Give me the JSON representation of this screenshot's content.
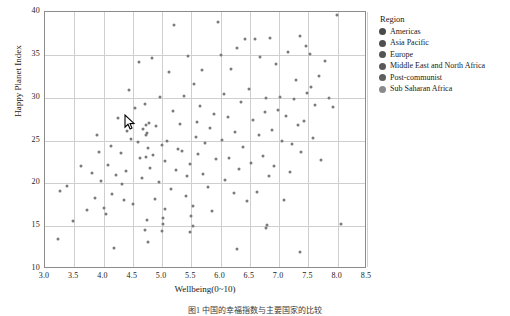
{
  "chart_data": {
    "type": "scatter",
    "title": "",
    "xlabel": "Wellbeing(0~10)",
    "ylabel": "Happy Planet Index",
    "xlim": [
      3.0,
      8.5
    ],
    "ylim": [
      10,
      40
    ],
    "grid": true,
    "legend_position": "right",
    "xticks": [
      "3.0",
      "3.5",
      "4.0",
      "4.5",
      "5.0",
      "5.5",
      "6.0",
      "6.5",
      "7.0",
      "7.5",
      "8.0",
      "8.5"
    ],
    "yticks": [
      "10",
      "15",
      "20",
      "25",
      "30",
      "35",
      "40"
    ],
    "xtick_values": [
      3.0,
      3.5,
      4.0,
      4.5,
      5.0,
      5.5,
      6.0,
      6.5,
      7.0,
      7.5,
      8.0,
      8.5
    ],
    "ytick_values": [
      10,
      15,
      20,
      25,
      30,
      35,
      40
    ],
    "marker_color": "#7a7a7a",
    "marker_size": 3,
    "legend": {
      "title": "Region",
      "entries": [
        {
          "label": "Americas",
          "color": "#4a4a4a"
        },
        {
          "label": "Asia Pacific",
          "color": "#4f4f4f"
        },
        {
          "label": "Europe",
          "color": "#545454"
        },
        {
          "label": "Middle East and North Africa",
          "color": "#595959"
        },
        {
          "label": "Post-communist",
          "color": "#5e5e5e"
        },
        {
          "label": "Sub Saharan Africa",
          "color": "#8a8a8a"
        }
      ]
    },
    "points": [
      [
        3.22,
        13.5
      ],
      [
        3.25,
        19.1
      ],
      [
        3.38,
        19.7
      ],
      [
        3.47,
        15.6
      ],
      [
        3.62,
        22.0
      ],
      [
        3.72,
        16.9
      ],
      [
        3.8,
        21.2
      ],
      [
        3.85,
        18.3
      ],
      [
        3.88,
        25.6
      ],
      [
        3.93,
        23.7
      ],
      [
        3.96,
        20.3
      ],
      [
        4.0,
        17.1
      ],
      [
        4.05,
        16.4
      ],
      [
        4.08,
        22.1
      ],
      [
        4.12,
        24.3
      ],
      [
        4.15,
        18.8
      ],
      [
        4.18,
        12.4
      ],
      [
        4.22,
        21.0
      ],
      [
        4.25,
        27.6
      ],
      [
        4.3,
        23.5
      ],
      [
        4.32,
        19.9
      ],
      [
        4.35,
        18.0
      ],
      [
        4.38,
        21.4
      ],
      [
        4.4,
        26.1
      ],
      [
        4.44,
        30.9
      ],
      [
        4.47,
        25.2
      ],
      [
        4.5,
        17.6
      ],
      [
        4.54,
        28.8
      ],
      [
        4.58,
        24.8
      ],
      [
        4.6,
        34.2
      ],
      [
        4.62,
        22.9
      ],
      [
        4.65,
        20.6
      ],
      [
        4.68,
        26.3
      ],
      [
        4.7,
        29.3
      ],
      [
        4.72,
        23.1
      ],
      [
        4.74,
        25.9
      ],
      [
        4.76,
        24.1
      ],
      [
        4.78,
        27.0
      ],
      [
        4.8,
        21.8
      ],
      [
        4.82,
        34.6
      ],
      [
        4.85,
        23.3
      ],
      [
        4.88,
        18.2
      ],
      [
        4.9,
        26.7
      ],
      [
        4.94,
        20.1
      ],
      [
        4.96,
        30.1
      ],
      [
        5.0,
        24.5
      ],
      [
        5.02,
        16.0
      ],
      [
        5.05,
        22.6
      ],
      [
        5.08,
        25.0
      ],
      [
        5.12,
        33.0
      ],
      [
        5.15,
        19.3
      ],
      [
        5.18,
        28.4
      ],
      [
        5.2,
        38.5
      ],
      [
        5.24,
        21.5
      ],
      [
        5.28,
        24.0
      ],
      [
        5.3,
        26.9
      ],
      [
        5.34,
        23.8
      ],
      [
        5.38,
        30.2
      ],
      [
        5.4,
        18.5
      ],
      [
        5.42,
        20.9
      ],
      [
        5.45,
        34.9
      ],
      [
        5.48,
        22.3
      ],
      [
        5.52,
        17.3
      ],
      [
        5.55,
        31.6
      ],
      [
        5.58,
        25.4
      ],
      [
        5.6,
        27.2
      ],
      [
        5.62,
        23.4
      ],
      [
        5.65,
        29.0
      ],
      [
        5.68,
        33.2
      ],
      [
        5.7,
        21.1
      ],
      [
        5.74,
        24.7
      ],
      [
        5.78,
        19.6
      ],
      [
        5.82,
        26.5
      ],
      [
        5.85,
        16.8
      ],
      [
        5.88,
        28.1
      ],
      [
        5.92,
        22.8
      ],
      [
        5.96,
        38.8
      ],
      [
        6.0,
        35.0
      ],
      [
        6.02,
        25.1
      ],
      [
        6.05,
        30.4
      ],
      [
        6.08,
        20.4
      ],
      [
        6.12,
        27.8
      ],
      [
        6.15,
        23.0
      ],
      [
        6.18,
        33.4
      ],
      [
        6.22,
        18.9
      ],
      [
        6.25,
        26.0
      ],
      [
        6.28,
        35.8
      ],
      [
        6.32,
        21.7
      ],
      [
        6.35,
        29.5
      ],
      [
        6.38,
        24.2
      ],
      [
        6.42,
        36.8
      ],
      [
        6.45,
        17.9
      ],
      [
        6.48,
        31.0
      ],
      [
        6.52,
        22.4
      ],
      [
        6.55,
        27.4
      ],
      [
        6.58,
        36.9
      ],
      [
        6.62,
        19.0
      ],
      [
        6.65,
        25.7
      ],
      [
        6.68,
        34.8
      ],
      [
        6.72,
        23.2
      ],
      [
        6.75,
        28.3
      ],
      [
        6.78,
        30.0
      ],
      [
        6.82,
        20.8
      ],
      [
        6.85,
        37.0
      ],
      [
        6.88,
        26.2
      ],
      [
        6.92,
        22.0
      ],
      [
        6.95,
        33.9
      ],
      [
        6.98,
        28.6
      ],
      [
        7.02,
        30.1
      ],
      [
        7.05,
        24.9
      ],
      [
        7.08,
        18.1
      ],
      [
        7.12,
        27.9
      ],
      [
        7.15,
        35.3
      ],
      [
        7.18,
        21.3
      ],
      [
        7.22,
        24.6
      ],
      [
        7.25,
        29.9
      ],
      [
        7.28,
        32.1
      ],
      [
        7.32,
        26.8
      ],
      [
        7.35,
        37.2
      ],
      [
        7.38,
        23.6
      ],
      [
        7.42,
        27.3
      ],
      [
        7.45,
        36.0
      ],
      [
        7.48,
        30.6
      ],
      [
        7.52,
        35.1
      ],
      [
        7.55,
        31.2
      ],
      [
        7.58,
        25.3
      ],
      [
        7.62,
        29.2
      ],
      [
        7.68,
        32.5
      ],
      [
        7.72,
        22.7
      ],
      [
        7.78,
        34.3
      ],
      [
        7.85,
        30.0
      ],
      [
        7.92,
        28.9
      ],
      [
        7.98,
        39.6
      ],
      [
        8.05,
        15.2
      ],
      [
        4.72,
        26.8
      ],
      [
        4.72,
        25.6
      ],
      [
        4.74,
        15.7
      ],
      [
        4.7,
        14.6
      ],
      [
        4.76,
        13.1
      ],
      [
        5.0,
        14.4
      ],
      [
        5.02,
        15.3
      ],
      [
        5.05,
        17.0
      ],
      [
        5.48,
        14.3
      ],
      [
        5.5,
        16.2
      ],
      [
        5.52,
        15.0
      ],
      [
        6.78,
        14.8
      ],
      [
        6.8,
        15.1
      ],
      [
        6.28,
        12.3
      ],
      [
        7.35,
        12.0
      ]
    ]
  },
  "axes": {
    "x_title": "Wellbeing(0~10)",
    "y_title": "Happy Planet Index"
  },
  "caption": "图1  中国的幸福指数与主要国家的比较"
}
